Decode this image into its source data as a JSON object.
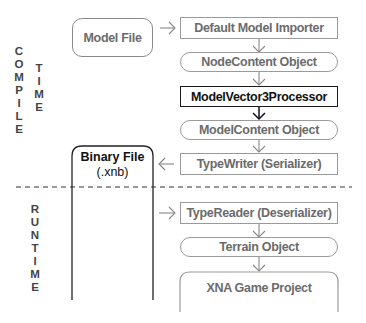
{
  "phases": {
    "compile": {
      "word1": "COMPILE",
      "word2": "TIME"
    },
    "runtime": {
      "word1": "RUNTIME"
    }
  },
  "left": {
    "model_file": "Model File",
    "binary_file_line1": "Binary File",
    "binary_file_line2": "(.xnb)"
  },
  "pipeline": {
    "importer": "Default Model Importer",
    "node_content": "NodeContent Object",
    "processor": "ModelVector3Processor",
    "model_content": "ModelContent Object",
    "type_writer": "TypeWriter (Serializer)",
    "type_reader": "TypeReader (Deserializer)",
    "terrain_object": "Terrain Object",
    "game_project": "XNA Game Project"
  },
  "colors": {
    "box_border": "#9a9a9a",
    "highlight_border": "#1a1a1a",
    "text_gray": "#6b6b6b",
    "text_dark": "#111111"
  }
}
